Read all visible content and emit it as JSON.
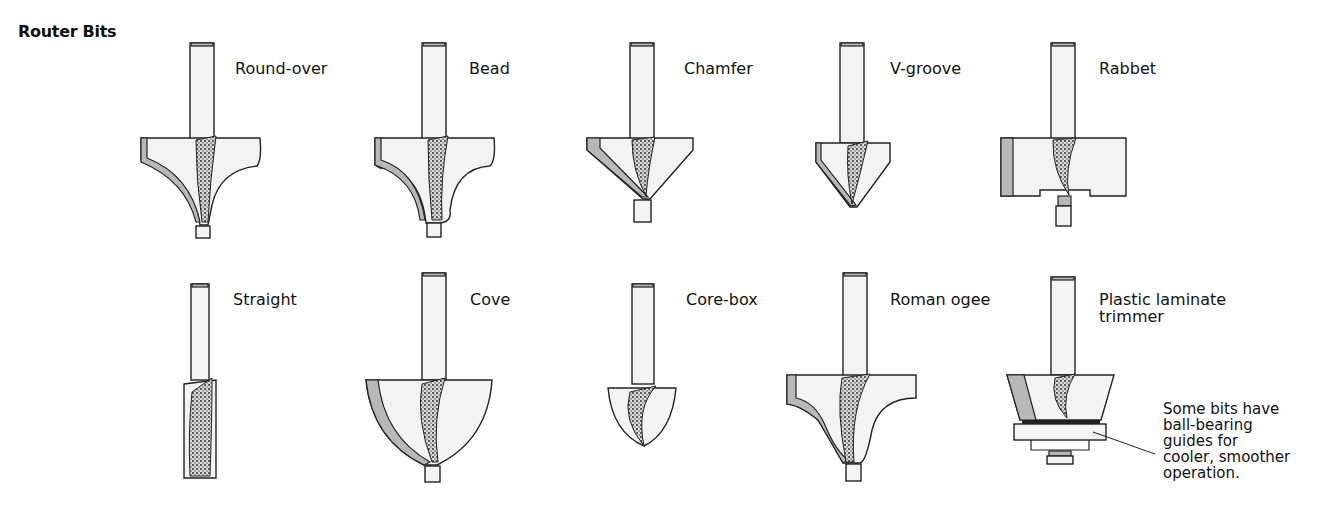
{
  "title": "Router Bits",
  "bits": [
    {
      "name": "Round-over",
      "row": 1
    },
    {
      "name": "Bead",
      "row": 1
    },
    {
      "name": "Chamfer",
      "row": 1
    },
    {
      "name": "V-groove",
      "row": 1
    },
    {
      "name": "Rabbet",
      "row": 1
    },
    {
      "name": "Straight",
      "row": 2
    },
    {
      "name": "Cove",
      "row": 2
    },
    {
      "name": "Core-box",
      "row": 2
    },
    {
      "name": "Roman ogee",
      "row": 2
    },
    {
      "name": "Plastic laminate trimmer",
      "row": 2
    }
  ],
  "labels": {
    "round_over": "Round-over",
    "bead": "Bead",
    "chamfer": "Chamfer",
    "v_groove": "V-groove",
    "rabbet": "Rabbet",
    "straight": "Straight",
    "cove": "Cove",
    "core_box": "Core-box",
    "roman_ogee": "Roman ogee",
    "laminate_line1": "Plastic laminate",
    "laminate_line2": "trimmer"
  },
  "callout": {
    "line1": "Some bits have",
    "line2": "ball-bearing",
    "line3": "guides for",
    "line4": "cooler, smoother",
    "line5": "operation."
  }
}
